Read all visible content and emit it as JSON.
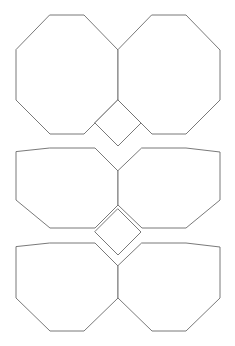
{
  "figure": {
    "type": "geometric-diagram",
    "width": 235,
    "height": 346,
    "background_color": "#ffffff",
    "stroke_color": "#6a6a6a",
    "stroke_width": 0.9,
    "fill_color": "#ffffff"
  },
  "geometry": {
    "octagon": {
      "count": 6,
      "half_width": 51,
      "corner_cut": 34,
      "centers": [
        {
          "name": "octagon-top-left",
          "cx": 67,
          "cy": 67
        },
        {
          "name": "octagon-top-right",
          "cx": 169,
          "cy": 67
        },
        {
          "name": "octagon-middle-left",
          "cx": 67,
          "cy": 188
        },
        {
          "name": "octagon-middle-right",
          "cx": 169,
          "cy": 188
        },
        {
          "name": "octagon-bottom-left",
          "cx": 67,
          "cy": 297
        },
        {
          "name": "octagon-bottom-right",
          "cx": 169,
          "cy": 297
        }
      ]
    },
    "square": {
      "count": 2,
      "half_diagonal": 23,
      "rotation_degrees": 45,
      "centers": [
        {
          "name": "square-upper",
          "cx": 118,
          "cy": 123
        },
        {
          "name": "square-lower",
          "cx": 118,
          "cy": 232
        }
      ]
    },
    "polygons": [
      {
        "name": "octagon-top-left",
        "points": "50,15 84,15 118,50 118,100 84,134 50,134 16,100 16,50"
      },
      {
        "name": "octagon-top-right",
        "points": "152,15 186,15 220,50 220,100 186,134 152,134 118,100 118,50"
      },
      {
        "name": "octagon-middle-left",
        "points": "50,148 95,148 118,171 118,205 95,228 50,228 16,200 16,152"
      },
      {
        "name": "octagon-middle-right",
        "points": "142,148 186,148 220,152 220,200 186,228 142,228 118,205 118,171"
      },
      {
        "name": "octagon-bottom-left",
        "points": "50,243 95,243 118,266 118,298 84,331 50,331 16,298 16,247"
      },
      {
        "name": "octagon-bottom-right",
        "points": "142,243 186,243 220,247 220,298 186,331 152,331 118,298 118,266"
      },
      {
        "name": "square-upper",
        "points": "118,100 141,123 118,146 95,123"
      },
      {
        "name": "square-lower",
        "points": "118,209 141,232 118,255 95,232"
      }
    ]
  }
}
